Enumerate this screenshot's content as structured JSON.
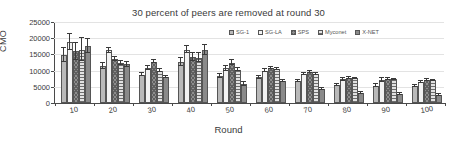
{
  "chart_data": {
    "type": "bar",
    "title": "30 percent of peers are removed at round 30",
    "xlabel": "Round",
    "ylabel": "CMO",
    "categories": [
      "10",
      "20",
      "30",
      "40",
      "50",
      "60",
      "70",
      "80",
      "90",
      "100"
    ],
    "ylim": [
      0,
      25000
    ],
    "yticks": [
      "0",
      "5000",
      "10000",
      "15000",
      "20000",
      "25000"
    ],
    "grid": true,
    "legend_position": "top-right-inside",
    "series": [
      {
        "name": "SG-1",
        "color": "#b9b9b9",
        "pattern": "solid-light",
        "values": [
          14900,
          11500,
          8800,
          12700,
          8300,
          8000,
          6800,
          5500,
          5400,
          5300
        ],
        "errors": [
          2100,
          900,
          500,
          1200,
          600,
          450,
          400,
          350,
          350,
          300
        ]
      },
      {
        "name": "SG-LA",
        "color": "#f2f2f2",
        "pattern": "blank",
        "values": [
          18800,
          16300,
          10800,
          16500,
          10700,
          10000,
          9000,
          7300,
          7100,
          6400
        ],
        "errors": [
          2400,
          800,
          600,
          1100,
          700,
          400,
          400,
          400,
          600,
          350
        ]
      },
      {
        "name": "SPS",
        "color": "#8d8d8d",
        "pattern": "cross-hatch",
        "values": [
          16000,
          13500,
          12700,
          14200,
          12400,
          10800,
          9600,
          7700,
          7400,
          7200
        ],
        "errors": [
          2600,
          600,
          500,
          1300,
          800,
          350,
          300,
          300,
          350,
          300
        ]
      },
      {
        "name": "Myconet",
        "color": "#e2e2e2",
        "pattern": "horizontal-lines",
        "values": [
          16500,
          12300,
          10000,
          14000,
          10300,
          10400,
          9000,
          7600,
          7300,
          7000
        ],
        "errors": [
          3500,
          700,
          550,
          1400,
          500,
          300,
          300,
          250,
          250,
          250
        ]
      },
      {
        "name": "X-NET",
        "color": "#8a8a8a",
        "pattern": "solid-medium",
        "values": [
          17500,
          11900,
          8000,
          16300,
          5800,
          6800,
          4300,
          3100,
          2700,
          2500
        ],
        "errors": [
          2200,
          900,
          400,
          1600,
          600,
          350,
          300,
          250,
          250,
          200
        ]
      }
    ]
  }
}
